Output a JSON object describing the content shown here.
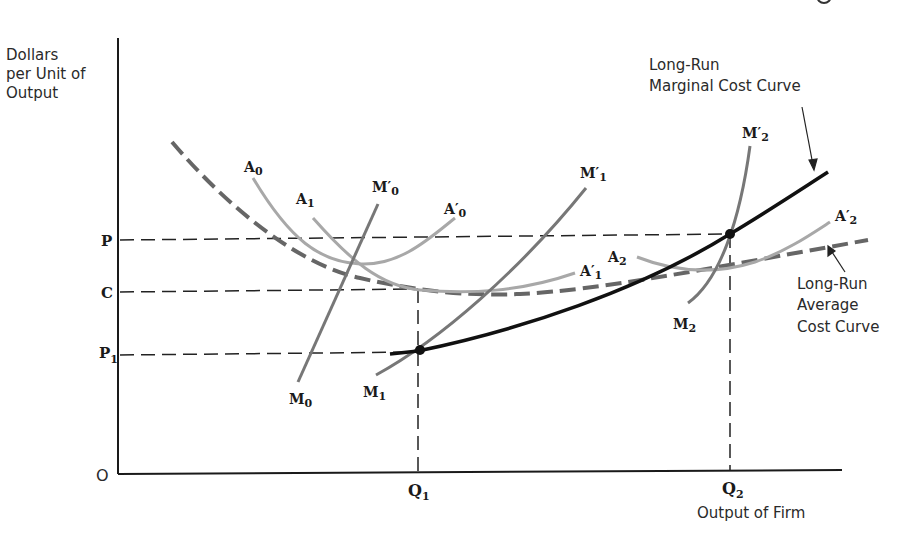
{
  "figure": {
    "y_axis_label": [
      "Dollars",
      "per Unit of",
      "Output"
    ],
    "x_axis_label": "Output of Firm",
    "origin_label": "O",
    "y_ticks": [
      {
        "label": "P",
        "sub": ""
      },
      {
        "label": "C",
        "sub": ""
      },
      {
        "label": "P",
        "sub": "1"
      }
    ],
    "x_ticks": [
      {
        "label": "Q",
        "sub": "1"
      },
      {
        "label": "Q",
        "sub": "2"
      }
    ],
    "curve_labels": {
      "A0": {
        "base": "A",
        "sub": "0",
        "prime": ""
      },
      "A1": {
        "base": "A",
        "sub": "1",
        "prime": ""
      },
      "A0p": {
        "base": "A",
        "sub": "0",
        "prime": "′"
      },
      "A1p": {
        "base": "A",
        "sub": "1",
        "prime": "′"
      },
      "A2": {
        "base": "A",
        "sub": "2",
        "prime": ""
      },
      "A2p": {
        "base": "A",
        "sub": "2",
        "prime": "′"
      },
      "M0": {
        "base": "M",
        "sub": "0",
        "prime": ""
      },
      "M0p": {
        "base": "M",
        "sub": "0",
        "prime": "′"
      },
      "M1": {
        "base": "M",
        "sub": "1",
        "prime": ""
      },
      "M1p": {
        "base": "M",
        "sub": "1",
        "prime": "′"
      },
      "M2": {
        "base": "M",
        "sub": "2",
        "prime": ""
      },
      "M2p": {
        "base": "M",
        "sub": "2",
        "prime": "′"
      }
    },
    "annotations": {
      "lrmc": [
        "Long-Run",
        "Marginal Cost Curve"
      ],
      "lrac": [
        "Long-Run",
        "Average",
        "Cost Curve"
      ]
    },
    "colors": {
      "axis": "#1a1a1a",
      "lrmc": "#111111",
      "lrac": "#666666",
      "short_run_avg": "#a8a8a8",
      "short_run_marginal": "#777777",
      "guide": "#222222"
    }
  }
}
